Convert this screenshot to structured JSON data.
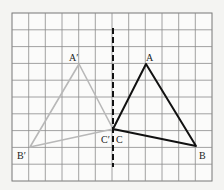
{
  "figure": {
    "grid": {
      "columns": 12,
      "rows": 10,
      "line_color": "#8a8a8a",
      "background": "#fbfbfa"
    },
    "mirror_line": {
      "style": "dashed",
      "color": "#111111",
      "column": 6
    },
    "triangles": [
      {
        "name": "original",
        "color": "#111111",
        "vertices": [
          {
            "label": "A",
            "grid": [
              8,
              3
            ]
          },
          {
            "label": "B",
            "grid": [
              11,
              8
            ]
          },
          {
            "label": "C",
            "grid": [
              6,
              7
            ]
          }
        ]
      },
      {
        "name": "image",
        "color": "#b8b8b8",
        "vertices": [
          {
            "label": "A′",
            "grid": [
              4,
              3
            ]
          },
          {
            "label": "B′",
            "grid": [
              1,
              8
            ]
          },
          {
            "label": "C′",
            "grid": [
              6,
              7
            ]
          }
        ]
      }
    ],
    "labels": {
      "A": "A",
      "B": "B",
      "C": "C",
      "A_prime": "A′",
      "B_prime": "B′",
      "C_prime": "C′"
    }
  }
}
